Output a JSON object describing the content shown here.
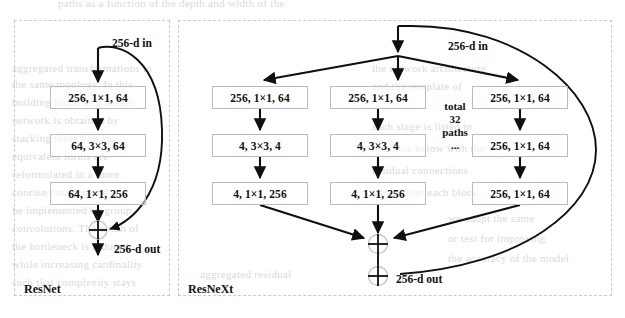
{
  "figure": {
    "caption_bleed": "paths as a function of the depth and width of the",
    "background_bleed": [
      {
        "text": "aggregated transformations in",
        "x": 12,
        "y": 62,
        "size": 11
      },
      {
        "text": "the same topology. In this",
        "x": 12,
        "y": 78,
        "size": 11
      },
      {
        "text": "building block of a deeper",
        "x": 12,
        "y": 96,
        "size": 11
      },
      {
        "text": "network is obtained by",
        "x": 12,
        "y": 114,
        "size": 11
      },
      {
        "text": "stacking these blocks",
        "x": 12,
        "y": 132,
        "size": 11
      },
      {
        "text": "equivalent forms are",
        "x": 12,
        "y": 150,
        "size": 11
      },
      {
        "text": "reformulated in a more",
        "x": 12,
        "y": 168,
        "size": 11
      },
      {
        "text": "concise notation and can",
        "x": 12,
        "y": 186,
        "size": 11
      },
      {
        "text": "be implemented by group",
        "x": 12,
        "y": 204,
        "size": 11
      },
      {
        "text": "convolutions. The width of",
        "x": 12,
        "y": 222,
        "size": 11
      },
      {
        "text": "the bottleneck is reduced",
        "x": 12,
        "y": 240,
        "size": 11
      },
      {
        "text": "while increasing cardinality",
        "x": 12,
        "y": 258,
        "size": 11
      },
      {
        "text": "such that complexity stays",
        "x": 12,
        "y": 276,
        "size": 11
      },
      {
        "text": "the network architecture",
        "x": 372,
        "y": 62,
        "size": 11
      },
      {
        "text": "and the template of",
        "x": 372,
        "y": 80,
        "size": 11
      },
      {
        "text": "each stage is listed in",
        "x": 372,
        "y": 120,
        "size": 11
      },
      {
        "text": "the table below with the",
        "x": 372,
        "y": 142,
        "size": 11
      },
      {
        "text": "residual connections",
        "x": 372,
        "y": 164,
        "size": 11
      },
      {
        "text": "added after each block",
        "x": 372,
        "y": 186,
        "size": 11
      },
      {
        "text": "we adopt the same",
        "x": 448,
        "y": 212,
        "size": 11
      },
      {
        "text": "or test for improving",
        "x": 448,
        "y": 232,
        "size": 11
      },
      {
        "text": "the accuracy of the model",
        "x": 448,
        "y": 252,
        "size": 11
      },
      {
        "text": "aggregated residual",
        "x": 200,
        "y": 268,
        "size": 11
      }
    ]
  },
  "colors": {
    "stroke": "#101010",
    "box_border": "#b9bcc2",
    "panel_border": "#c9cbd0",
    "bleed_text": "#d9dade",
    "text": "#111111"
  },
  "panels": [
    {
      "name": "resnet",
      "label": "ResNet",
      "x": 14,
      "y": 20,
      "w": 156,
      "h": 276,
      "label_x": 24,
      "label_y": 282
    },
    {
      "name": "resnext",
      "label": "ResNeXt",
      "x": 178,
      "y": 20,
      "w": 434,
      "h": 276,
      "label_x": 188,
      "label_y": 282
    }
  ],
  "resnet": {
    "in_label": "256-d in",
    "out_label": "256-d out",
    "boxes": [
      {
        "text": "256, 1×1, 64",
        "x": 50,
        "y": 86,
        "w": 96,
        "h": 23
      },
      {
        "text": "64, 3×3, 64",
        "x": 50,
        "y": 134,
        "w": 96,
        "h": 23
      },
      {
        "text": "64, 1×1, 256",
        "x": 50,
        "y": 182,
        "w": 96,
        "h": 23
      }
    ]
  },
  "resnext": {
    "in_label": "256-d in",
    "out_label": "256-d out",
    "paths_note": {
      "line1": "total",
      "line2": "32",
      "line3": "paths",
      "line4": "..."
    },
    "columns": [
      {
        "name": "path-1",
        "boxes": [
          {
            "text": "256, 1×1, 64",
            "x": 212,
            "y": 86,
            "w": 96,
            "h": 23
          },
          {
            "text": "4, 3×3, 4",
            "x": 212,
            "y": 134,
            "w": 96,
            "h": 23
          },
          {
            "text": "4, 1×1, 256",
            "x": 212,
            "y": 182,
            "w": 96,
            "h": 23
          }
        ]
      },
      {
        "name": "path-2",
        "boxes": [
          {
            "text": "256, 1×1, 64",
            "x": 330,
            "y": 86,
            "w": 96,
            "h": 23
          },
          {
            "text": "4, 3×3, 4",
            "x": 330,
            "y": 134,
            "w": 96,
            "h": 23
          },
          {
            "text": "4, 1×1, 256",
            "x": 330,
            "y": 182,
            "w": 96,
            "h": 23
          }
        ]
      },
      {
        "name": "path-32",
        "boxes": [
          {
            "text": "256, 1×1, 64",
            "x": 472,
            "y": 86,
            "w": 96,
            "h": 23
          },
          {
            "text": "256, 1×1, 64",
            "x": 472,
            "y": 134,
            "w": 96,
            "h": 23
          },
          {
            "text": "256, 1×1, 64",
            "x": 472,
            "y": 182,
            "w": 96,
            "h": 23
          }
        ]
      }
    ]
  },
  "chart_data": {
    "type": "diagram",
    "blocks": {
      "ResNet": {
        "input": "256-d in",
        "output": "256-d out",
        "paths": 1,
        "layers": [
          "256, 1×1, 64",
          "64, 3×3, 64",
          "64, 1×1, 256"
        ],
        "skip_connection": true,
        "aggregation": "sum"
      },
      "ResNeXt": {
        "input": "256-d in",
        "output": "256-d out",
        "paths": 32,
        "paths_note": "total 32 paths ...",
        "path_layers": [
          "256, 1×1, 64",
          "4, 3×3, 4",
          "4, 1×1, 256"
        ],
        "last_path_layers": [
          "256, 1×1, 64",
          "256, 1×1, 64",
          "256, 1×1, 64"
        ],
        "skip_connection": true,
        "aggregation": "sum of 32 paths, then sum with shortcut"
      }
    }
  }
}
